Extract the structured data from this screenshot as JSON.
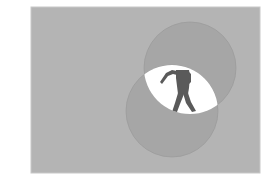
{
  "image": {
    "description": "Grey panel with two overlapping grey circles; the lens-shaped overlap is white and reveals a dark silhouette of a standing person with one arm raised.",
    "colors": {
      "page_background": "#ffffff",
      "panel_fill": "#b4b4b4",
      "panel_border": "#c8c8c8",
      "circle_fill": "#a6a6a6",
      "circle_edge": "#9c9c9c",
      "overlap_fill": "#ffffff",
      "figure_fill": "#5a5a5a"
    },
    "panel": {
      "x": 31,
      "y": 7,
      "width": 229,
      "height": 166
    },
    "circles": [
      {
        "name": "upper-circle",
        "cx": 190,
        "cy": 68,
        "r": 46
      },
      {
        "name": "lower-circle",
        "cx": 172,
        "cy": 111,
        "r": 46
      }
    ]
  }
}
